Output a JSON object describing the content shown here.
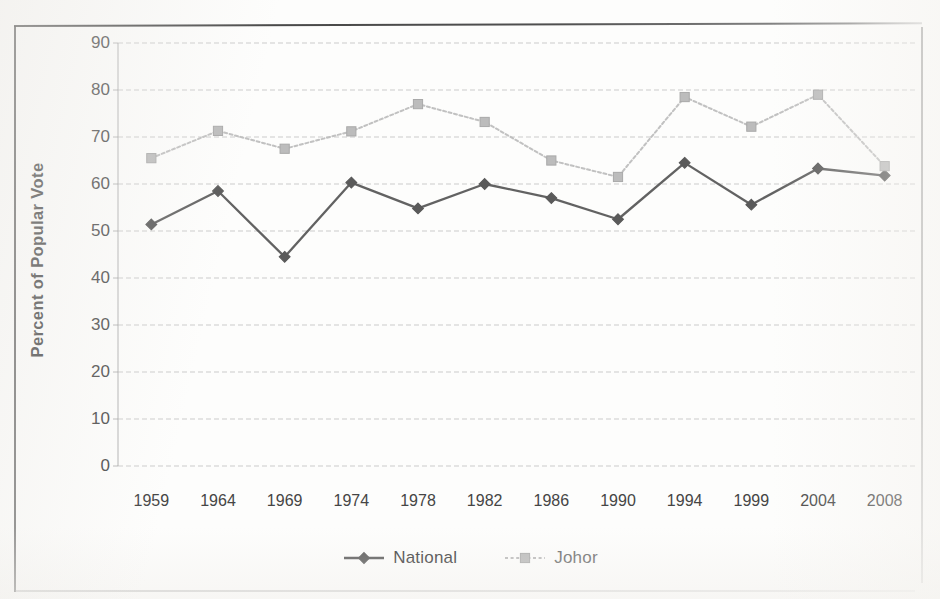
{
  "chart_data": {
    "type": "line",
    "title": "",
    "subtitle": "",
    "xlabel": "",
    "ylabel": "Percent of Popular Vote",
    "categories": [
      "1959",
      "1964",
      "1969",
      "1974",
      "1978",
      "1982",
      "1986",
      "1990",
      "1994",
      "1999",
      "2004",
      "2008"
    ],
    "x_tick_labels": [
      "1959",
      "1964",
      "1969",
      "1974",
      "1978",
      "1982",
      "1986",
      "1990",
      "1994",
      "1999",
      "2004",
      "2008"
    ],
    "y_tick_labels": [
      "90",
      "80",
      "70",
      "60",
      "50",
      "40",
      "30",
      "20",
      "10",
      "0"
    ],
    "y_ticks": [
      90,
      80,
      70,
      60,
      50,
      40,
      30,
      20,
      10,
      0
    ],
    "ylim": [
      0,
      90
    ],
    "grid": "horizontal",
    "legend_position": "bottom-center",
    "series": [
      {
        "name": "National",
        "color": "#5a5a5a",
        "marker": "diamond",
        "line_style": "solid",
        "values": [
          51.4,
          58.5,
          44.5,
          60.3,
          54.8,
          60.0,
          57.0,
          52.5,
          64.5,
          55.6,
          63.3,
          61.8
        ]
      },
      {
        "name": "Johor",
        "color": "#bcbcbc",
        "marker": "square",
        "line_style": "dotted",
        "values": [
          65.5,
          71.3,
          67.5,
          71.2,
          77.0,
          73.2,
          65.0,
          61.5,
          78.5,
          72.2,
          79.0,
          63.8
        ]
      }
    ]
  },
  "legend": {
    "entries": [
      {
        "label": "National"
      },
      {
        "label": "Johor"
      }
    ]
  },
  "axes": {
    "y_title": "Percent of Popular Vote"
  }
}
